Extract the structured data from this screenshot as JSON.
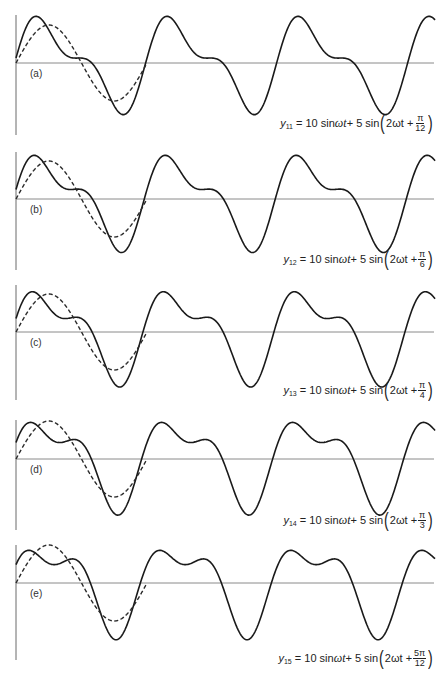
{
  "figure": {
    "fundamental": {
      "amplitude": 10,
      "harmonic": 1,
      "phase": 0,
      "label": "10 sin ωt",
      "style": "dashed",
      "periods_shown": 1
    },
    "colors": {
      "solid": "#1a1a1a",
      "dashed": "#2a2a2a",
      "axis": "#6b6b6b"
    }
  },
  "chart_data": [
    {
      "type": "line",
      "panel": "(a)",
      "title": "",
      "equation": {
        "y_label": "y",
        "y_sub": "11",
        "lhs": "= 10 sin ",
        "omega_t": "ωt",
        "plus": " + 5 sin",
        "inner": "2ωt +",
        "num": "π",
        "den": "12"
      },
      "xlabel": "ωt",
      "ylabel": "y",
      "x_range_radians": [
        0,
        20.1
      ],
      "ylim": [
        -15,
        15
      ],
      "series": [
        {
          "name": "y11",
          "style": "solid",
          "terms": [
            {
              "amp": 10,
              "k": 1,
              "phase": 0
            },
            {
              "amp": 5,
              "k": 2,
              "phase_over_pi": 0.0833333
            }
          ]
        },
        {
          "name": "10 sin ωt",
          "style": "dashed",
          "terms": [
            {
              "amp": 10,
              "k": 1,
              "phase": 0
            }
          ],
          "x_range_radians": [
            0,
            6.2832
          ]
        }
      ]
    },
    {
      "type": "line",
      "panel": "(b)",
      "title": "",
      "equation": {
        "y_label": "y",
        "y_sub": "12",
        "lhs": "= 10 sin ",
        "omega_t": "ωt",
        "plus": " + 5 sin",
        "inner": "2ωt +",
        "num": "π",
        "den": "6"
      },
      "xlabel": "ωt",
      "ylabel": "y",
      "x_range_radians": [
        0,
        20.1
      ],
      "ylim": [
        -15,
        15
      ],
      "series": [
        {
          "name": "y12",
          "style": "solid",
          "terms": [
            {
              "amp": 10,
              "k": 1,
              "phase": 0
            },
            {
              "amp": 5,
              "k": 2,
              "phase_over_pi": 0.1666667
            }
          ]
        },
        {
          "name": "10 sin ωt",
          "style": "dashed",
          "terms": [
            {
              "amp": 10,
              "k": 1,
              "phase": 0
            }
          ],
          "x_range_radians": [
            0,
            6.2832
          ]
        }
      ]
    },
    {
      "type": "line",
      "panel": "(c)",
      "title": "",
      "equation": {
        "y_label": "y",
        "y_sub": "13",
        "lhs": "= 10 sin ",
        "omega_t": "ωt",
        "plus": " + 5 sin",
        "inner": "2ωt +",
        "num": "π",
        "den": "4"
      },
      "xlabel": "ωt",
      "ylabel": "y",
      "x_range_radians": [
        0,
        20.1
      ],
      "ylim": [
        -15,
        15
      ],
      "series": [
        {
          "name": "y13",
          "style": "solid",
          "terms": [
            {
              "amp": 10,
              "k": 1,
              "phase": 0
            },
            {
              "amp": 5,
              "k": 2,
              "phase_over_pi": 0.25
            }
          ]
        },
        {
          "name": "10 sin ωt",
          "style": "dashed",
          "terms": [
            {
              "amp": 10,
              "k": 1,
              "phase": 0
            }
          ],
          "x_range_radians": [
            0,
            6.2832
          ]
        }
      ]
    },
    {
      "type": "line",
      "panel": "(d)",
      "title": "",
      "equation": {
        "y_label": "y",
        "y_sub": "14",
        "lhs": "= 10 sin ",
        "omega_t": "ωt",
        "plus": " + 5 sin",
        "inner": "2ωt +",
        "num": "π",
        "den": "3"
      },
      "xlabel": "ωt",
      "ylabel": "y",
      "x_range_radians": [
        0,
        20.1
      ],
      "ylim": [
        -15,
        15
      ],
      "series": [
        {
          "name": "y14",
          "style": "solid",
          "terms": [
            {
              "amp": 10,
              "k": 1,
              "phase": 0
            },
            {
              "amp": 5,
              "k": 2,
              "phase_over_pi": 0.3333333
            }
          ]
        },
        {
          "name": "10 sin ωt",
          "style": "dashed",
          "terms": [
            {
              "amp": 10,
              "k": 1,
              "phase": 0
            }
          ],
          "x_range_radians": [
            0,
            6.2832
          ]
        }
      ]
    },
    {
      "type": "line",
      "panel": "(e)",
      "title": "",
      "equation": {
        "y_label": "y",
        "y_sub": "15",
        "lhs": "= 10 sin ",
        "omega_t": "ωt",
        "plus": " + 5 sin",
        "inner": "2ωt +",
        "num": "5π",
        "den": "12"
      },
      "xlabel": "ωt",
      "ylabel": "y",
      "x_range_radians": [
        0,
        20.1
      ],
      "ylim": [
        -15,
        15
      ],
      "series": [
        {
          "name": "y15",
          "style": "solid",
          "terms": [
            {
              "amp": 10,
              "k": 1,
              "phase": 0
            },
            {
              "amp": 5,
              "k": 2,
              "phase_over_pi": 0.4166667
            }
          ]
        },
        {
          "name": "10 sin ωt",
          "style": "dashed",
          "terms": [
            {
              "amp": 10,
              "k": 1,
              "phase": 0
            }
          ],
          "x_range_radians": [
            0,
            6.2832
          ]
        }
      ]
    }
  ]
}
